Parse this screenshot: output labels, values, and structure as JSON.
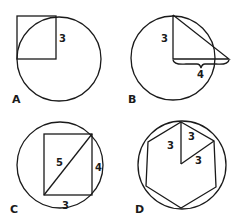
{
  "panels": {
    "A": {
      "label": "A",
      "side_label": "3"
    },
    "B": {
      "label": "B",
      "vertical_label": "3",
      "base_label": "4"
    },
    "C": {
      "label": "C",
      "diagonal_label": "5",
      "side_label": "4",
      "base_label": "3"
    },
    "D": {
      "label": "D",
      "radius_label_1": "3",
      "side_label": "3",
      "radius_label_2": "3"
    }
  },
  "colors": {
    "ink": "#1a1a1a",
    "background": "#ffffff"
  }
}
